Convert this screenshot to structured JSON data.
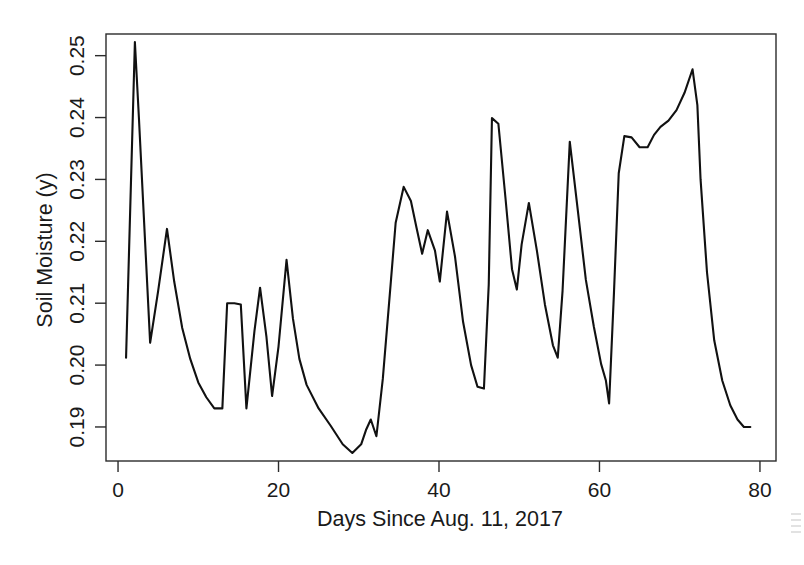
{
  "figure": {
    "background_color": "#ffffff",
    "line_color": "#111111",
    "axis_color": "#2b2b2b"
  },
  "chart_data": {
    "type": "line",
    "title": "",
    "xlabel": "Days Since Aug. 11, 2017",
    "ylabel": "Soil Moisture (y)",
    "xlim": [
      -1.5,
      82
    ],
    "ylim": [
      0.1845,
      0.2535
    ],
    "xticks": [
      0,
      20,
      40,
      60,
      80
    ],
    "xtick_labels": [
      "0",
      "20",
      "40",
      "60",
      "80"
    ],
    "yticks": [
      0.19,
      0.2,
      0.21,
      0.22,
      0.23,
      0.24,
      0.25
    ],
    "ytick_labels": [
      "0.19",
      "0.20",
      "0.21",
      "0.22",
      "0.23",
      "0.24",
      "0.25"
    ],
    "grid": false,
    "legend": false,
    "series": [
      {
        "name": "Soil Moisture",
        "color": "#111111",
        "x": [
          1.0,
          2.1,
          2.6,
          4.0,
          5.0,
          6.1,
          7.0,
          8.0,
          9.0,
          10.0,
          11.0,
          12.0,
          13.0,
          13.6,
          14.5,
          15.3,
          16.0,
          17.0,
          17.7,
          18.5,
          19.2,
          20.0,
          21.0,
          21.8,
          22.6,
          23.5,
          25.0,
          26.5,
          28.0,
          29.2,
          30.3,
          30.9,
          31.5,
          32.2,
          33.0,
          34.0,
          34.6,
          35.6,
          36.5,
          37.2,
          37.9,
          38.6,
          39.5,
          40.1,
          41.0,
          42.0,
          43.0,
          44.0,
          44.8,
          45.6,
          46.2,
          46.6,
          47.4,
          48.3,
          49.1,
          49.7,
          50.3,
          51.2,
          52.2,
          53.2,
          54.2,
          54.8,
          55.4,
          56.3,
          57.3,
          58.3,
          59.3,
          60.2,
          60.8,
          61.2,
          61.8,
          62.4,
          63.1,
          64.0,
          65.0,
          66.0,
          66.8,
          67.6,
          68.6,
          69.6,
          70.6,
          71.6,
          72.2,
          72.6,
          73.4,
          74.3,
          75.3,
          76.3,
          77.2,
          78.0,
          78.8
        ],
        "y": [
          0.2012,
          0.2522,
          0.24,
          0.2036,
          0.212,
          0.222,
          0.2135,
          0.206,
          0.201,
          0.1972,
          0.1948,
          0.193,
          0.193,
          0.21,
          0.21,
          0.2098,
          0.193,
          0.2055,
          0.2125,
          0.2045,
          0.195,
          0.203,
          0.217,
          0.2075,
          0.201,
          0.1968,
          0.193,
          0.1902,
          0.1872,
          0.1858,
          0.1872,
          0.1895,
          0.1912,
          0.1885,
          0.1978,
          0.2135,
          0.223,
          0.2288,
          0.2265,
          0.2222,
          0.218,
          0.2218,
          0.2185,
          0.2135,
          0.2248,
          0.2175,
          0.207,
          0.2,
          0.1965,
          0.1962,
          0.213,
          0.2399,
          0.239,
          0.2268,
          0.2155,
          0.2122,
          0.2195,
          0.2262,
          0.2185,
          0.2098,
          0.2032,
          0.2012,
          0.212,
          0.2361,
          0.225,
          0.2138,
          0.2062,
          0.2002,
          0.1975,
          0.1938,
          0.2115,
          0.231,
          0.237,
          0.2368,
          0.2352,
          0.2352,
          0.2372,
          0.2385,
          0.2395,
          0.2412,
          0.244,
          0.2478,
          0.242,
          0.23,
          0.215,
          0.204,
          0.1975,
          0.1935,
          0.1912,
          0.19,
          0.19
        ]
      }
    ]
  }
}
